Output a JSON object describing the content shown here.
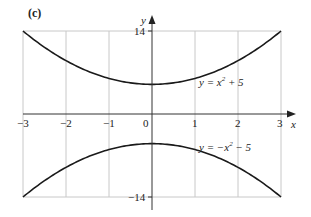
{
  "panel_label": "(c)",
  "chart_data": {
    "type": "line",
    "title": "",
    "xlabel": "x",
    "ylabel": "y",
    "xlim": [
      -3,
      3
    ],
    "ylim": [
      -14,
      14
    ],
    "grid": true,
    "x_ticks": [
      "-3",
      "-2",
      "-1",
      "0",
      "1",
      "2",
      "3"
    ],
    "y_ticks": [
      "14",
      "-14"
    ],
    "series": [
      {
        "name": "y = x² + 5",
        "x": [
          -3,
          -2,
          -1,
          0,
          1,
          2,
          3
        ],
        "values": [
          14,
          9,
          6,
          5,
          6,
          9,
          14
        ]
      },
      {
        "name": "y = −x² − 5",
        "x": [
          -3,
          -2,
          -1,
          0,
          1,
          2,
          3
        ],
        "values": [
          -14,
          -9,
          -6,
          -5,
          -6,
          -9,
          -14
        ]
      }
    ],
    "annotations": [
      {
        "text": "y = x² + 5",
        "x": 1.6,
        "y": 5.5
      },
      {
        "text": "y = −x² − 5",
        "x": 1.6,
        "y": -4.5
      }
    ]
  },
  "labels": {
    "x_axis": "x",
    "y_axis": "y",
    "x_ticks": [
      "−3",
      "−2",
      "−1",
      "0",
      "1",
      "2",
      "3"
    ],
    "y_top": "14",
    "y_bottom": "−14",
    "eq_top_prefix": "y = x",
    "eq_top_exp": "2",
    "eq_top_suffix": " + 5",
    "eq_bottom_prefix": "y = −x",
    "eq_bottom_exp": "2",
    "eq_bottom_suffix": " − 5"
  },
  "colors": {
    "curve": "#1a1a1a",
    "grid": "#c8c8c8",
    "axis": "#333333"
  }
}
